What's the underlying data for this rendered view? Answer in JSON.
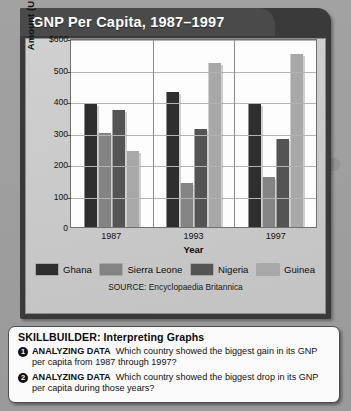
{
  "card": {
    "title": "GNP Per Capita, 1987–1997",
    "source": "SOURCE: Encyclopaedia Britannica"
  },
  "chart_data": {
    "type": "bar",
    "title": "GNP Per Capita, 1987–1997",
    "xlabel": "Year",
    "ylabel": "Amount (U.S. Dollars)",
    "categories": [
      "1987",
      "1993",
      "1997"
    ],
    "ylim": [
      0,
      600
    ],
    "yticks": [
      "0",
      "100",
      "200",
      "300",
      "400",
      "500",
      "$600"
    ],
    "ytick_values": [
      0,
      100,
      200,
      300,
      400,
      500,
      600
    ],
    "grid": true,
    "legend_position": "bottom",
    "series": [
      {
        "name": "Ghana",
        "color": "#2e2e2e",
        "values": [
          390,
          430,
          390
        ]
      },
      {
        "name": "Sierra Leone",
        "color": "#848484",
        "values": [
          300,
          140,
          160
        ]
      },
      {
        "name": "Nigeria",
        "color": "#545454",
        "values": [
          370,
          310,
          280
        ]
      },
      {
        "name": "Guinea",
        "color": "#a8a8a8",
        "values": [
          240,
          520,
          550
        ]
      }
    ]
  },
  "skillbuilder": {
    "title": "SKILLBUILDER: Interpreting Graphs",
    "questions": [
      {
        "number": "1",
        "label": "ANALYZING DATA",
        "text": "Which country showed the biggest gain in its GNP per capita from 1987 through 1997?"
      },
      {
        "number": "2",
        "label": "ANALYZING DATA",
        "text": "Which country showed the biggest drop in its GNP per capita during those years?"
      }
    ]
  }
}
